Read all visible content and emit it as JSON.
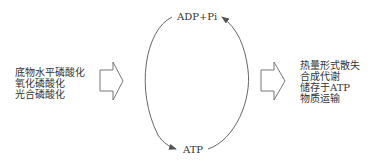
{
  "cycle": {
    "top_label": "ADP+Pi",
    "bottom_label": "ATP"
  },
  "inputs": {
    "items": [
      "底物水平磷酸化",
      "氧化磷酸化",
      "光合磷酸化"
    ]
  },
  "outputs": {
    "items": [
      "热量形式散失",
      "合成代谢",
      "储存于ATP",
      "物质运输"
    ]
  },
  "colors": {
    "stroke": "#666666",
    "text": "#333333",
    "background": "#ffffff"
  }
}
